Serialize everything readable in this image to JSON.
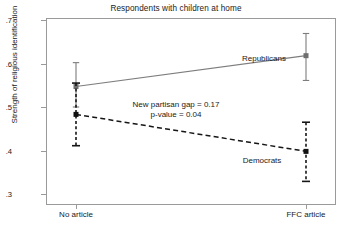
{
  "chart_data": {
    "type": "line",
    "title": "Respondents with children at home",
    "xlabel": "",
    "ylabel": "Strength of religious identification",
    "categories": [
      "No article",
      "FFC article"
    ],
    "x_positions": [
      76,
      306
    ],
    "ylim": [
      0.3,
      0.7
    ],
    "yticks": [
      0.7,
      0.6,
      0.5,
      0.4,
      0.3
    ],
    "ytick_labels": [
      ".7",
      ".6",
      ".5",
      ".4",
      ".3"
    ],
    "grid": false,
    "legend_position": "inline-labels",
    "series": [
      {
        "name": "Republicans",
        "values": [
          0.547,
          0.618
        ],
        "ci_low": [
          0.5,
          0.561
        ],
        "ci_high": [
          0.602,
          0.669
        ],
        "line_style": "solid",
        "color": "#7d7d7d",
        "marker_color": "#6e6e6e",
        "label_x": 264,
        "label_y": 58
      },
      {
        "name": "Democrats",
        "values": [
          0.483,
          0.398
        ],
        "ci_low": [
          0.411,
          0.329
        ],
        "ci_high": [
          0.555,
          0.465
        ],
        "line_style": "dashed",
        "color": "#161616",
        "marker_color": "#111111",
        "label_x": 262,
        "label_y": 160
      }
    ],
    "annotations": [
      {
        "lines": [
          "New partisan gap = 0.17",
          "p-value = 0.04"
        ],
        "x": 190,
        "y": 100
      }
    ]
  },
  "axes": {
    "frame_color": "#9a9a9a",
    "background": "#ffffff"
  }
}
